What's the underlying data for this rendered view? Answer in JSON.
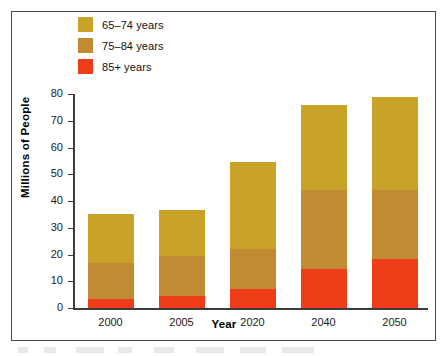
{
  "chart_data": {
    "type": "bar",
    "subtype": "stacked-bar",
    "title": "",
    "xlabel": "Year",
    "ylabel": "Millions of People",
    "categories": [
      "2000",
      "2005",
      "2020",
      "2040",
      "2050"
    ],
    "ylim": [
      0,
      80
    ],
    "yticks": [
      0,
      10,
      20,
      30,
      40,
      50,
      60,
      70,
      80
    ],
    "ytick_labels": [
      "0",
      "10",
      "20",
      "30",
      "40",
      "50",
      "60",
      "70",
      "80"
    ],
    "grid": false,
    "legend_position": "top-left-inside",
    "series": [
      {
        "name": "85+ years",
        "color": "#EF3C19",
        "values": [
          3.5,
          4.5,
          7,
          14.5,
          18.5
        ]
      },
      {
        "name": "75–84 years",
        "color": "#C08B33",
        "values": [
          13.5,
          15,
          15,
          29.5,
          25.5
        ]
      },
      {
        "name": "65–74 years",
        "color": "#C9A229",
        "values": [
          18,
          17,
          32.5,
          32,
          35
        ]
      }
    ],
    "totals": [
      35,
      36.5,
      54.5,
      76,
      79
    ],
    "stack_order_bottom_to_top": [
      "85+ years",
      "75–84 years",
      "65–74 years"
    ]
  },
  "legend": {
    "items": [
      {
        "label": "65–74 years",
        "color": "#C9A229",
        "swatch_name": "legend-swatch-65-74"
      },
      {
        "label": "75–84 years",
        "color": "#C08B33",
        "swatch_name": "legend-swatch-75-84"
      },
      {
        "label": "85+ years",
        "color": "#EF3C19",
        "swatch_name": "legend-swatch-85-plus"
      }
    ]
  },
  "axes": {
    "y_axis_title": "Millions of People",
    "x_axis_title": "Year"
  },
  "colors": {
    "band_65_74": "#C9A229",
    "band_75_84": "#C08B33",
    "band_85_plus": "#EF3C19",
    "frame": "#4a4a4a",
    "axis": "#3c3c3c",
    "background": "#ffffff"
  }
}
